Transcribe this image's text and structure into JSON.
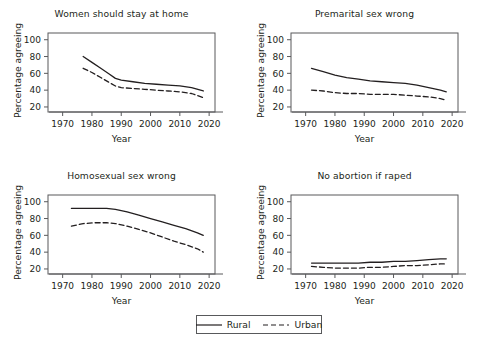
{
  "figure": {
    "background": "#ffffff",
    "line_color": "#231f20",
    "axis_color": "#58595b"
  },
  "legend": {
    "position": "bottom-center",
    "entries": [
      {
        "label": "Rural",
        "style": "solid",
        "icon": "solid-line-swatch"
      },
      {
        "label": "Urban",
        "style": "dashed",
        "icon": "dashed-line-swatch"
      }
    ]
  },
  "chart_data": [
    {
      "type": "line",
      "title": "Women should stay at home",
      "xlabel": "Year",
      "ylabel": "Percentage agreeing",
      "xlim": [
        1965,
        2022
      ],
      "ylim": [
        14,
        108
      ],
      "xticks": [
        1970,
        1980,
        1990,
        2000,
        2010,
        2020
      ],
      "yticks": [
        20,
        40,
        60,
        80,
        100
      ],
      "grid": false,
      "legend": "shared-bottom",
      "series": [
        {
          "name": "Rural",
          "style": "solid",
          "x": [
            1977,
            1980,
            1983,
            1986,
            1988,
            1990,
            1994,
            1998,
            2002,
            2006,
            2010,
            2014,
            2018
          ],
          "values": [
            80,
            73,
            66,
            59,
            54,
            52,
            50,
            48,
            47,
            46,
            45,
            43,
            39
          ]
        },
        {
          "name": "Urban",
          "style": "dashed",
          "x": [
            1977,
            1980,
            1983,
            1986,
            1988,
            1990,
            1994,
            1998,
            2002,
            2006,
            2010,
            2014,
            2018
          ],
          "values": [
            66,
            61,
            55,
            49,
            45,
            43,
            42,
            41,
            40,
            39,
            38,
            36,
            31
          ]
        }
      ]
    },
    {
      "type": "line",
      "title": "Premarital sex wrong",
      "xlabel": "Year",
      "ylabel": "Percentage agreeing",
      "xlim": [
        1965,
        2022
      ],
      "ylim": [
        14,
        108
      ],
      "xticks": [
        1970,
        1980,
        1990,
        2000,
        2010,
        2020
      ],
      "yticks": [
        20,
        40,
        60,
        80,
        100
      ],
      "grid": false,
      "legend": "shared-bottom",
      "series": [
        {
          "name": "Rural",
          "style": "solid",
          "x": [
            1972,
            1976,
            1980,
            1984,
            1988,
            1992,
            1996,
            2000,
            2004,
            2008,
            2012,
            2016,
            2018
          ],
          "values": [
            66,
            62,
            58,
            55,
            53,
            51,
            50,
            49,
            48,
            46,
            43,
            40,
            38
          ]
        },
        {
          "name": "Urban",
          "style": "dashed",
          "x": [
            1972,
            1976,
            1980,
            1984,
            1988,
            1992,
            1996,
            2000,
            2004,
            2008,
            2012,
            2016,
            2018
          ],
          "values": [
            40,
            39,
            37,
            36,
            36,
            35,
            35,
            35,
            34,
            33,
            32,
            30,
            28
          ]
        }
      ]
    },
    {
      "type": "line",
      "title": "Homosexual sex wrong",
      "xlabel": "Year",
      "ylabel": "Percentage agreeing",
      "xlim": [
        1965,
        2022
      ],
      "ylim": [
        14,
        108
      ],
      "xticks": [
        1970,
        1980,
        1990,
        2000,
        2010,
        2020
      ],
      "yticks": [
        20,
        40,
        60,
        80,
        100
      ],
      "grid": false,
      "legend": "shared-bottom",
      "series": [
        {
          "name": "Rural",
          "style": "solid",
          "x": [
            1973,
            1977,
            1981,
            1985,
            1988,
            1992,
            1996,
            2000,
            2004,
            2008,
            2012,
            2016,
            2018
          ],
          "values": [
            92,
            92,
            92,
            92,
            91,
            88,
            84,
            80,
            76,
            72,
            68,
            63,
            60
          ]
        },
        {
          "name": "Urban",
          "style": "dashed",
          "x": [
            1973,
            1977,
            1981,
            1985,
            1988,
            1992,
            1996,
            2000,
            2004,
            2008,
            2012,
            2016,
            2018
          ],
          "values": [
            71,
            74,
            75,
            75,
            74,
            71,
            67,
            63,
            58,
            53,
            49,
            44,
            40
          ]
        }
      ]
    },
    {
      "type": "line",
      "title": "No abortion if raped",
      "xlabel": "Year",
      "ylabel": "Percentage agreeing",
      "xlim": [
        1965,
        2022
      ],
      "ylim": [
        14,
        108
      ],
      "xticks": [
        1970,
        1980,
        1990,
        2000,
        2010,
        2020
      ],
      "yticks": [
        20,
        40,
        60,
        80,
        100
      ],
      "grid": false,
      "legend": "shared-bottom",
      "series": [
        {
          "name": "Rural",
          "style": "solid",
          "x": [
            1972,
            1976,
            1980,
            1984,
            1988,
            1992,
            1996,
            2000,
            2004,
            2008,
            2012,
            2016,
            2018
          ],
          "values": [
            27,
            27,
            27,
            27,
            27,
            28,
            28,
            29,
            29,
            30,
            31,
            32,
            32
          ]
        },
        {
          "name": "Urban",
          "style": "dashed",
          "x": [
            1972,
            1976,
            1980,
            1984,
            1988,
            1992,
            1996,
            2000,
            2004,
            2008,
            2012,
            2016,
            2018
          ],
          "values": [
            23,
            22,
            21,
            21,
            21,
            22,
            22,
            23,
            24,
            24,
            25,
            26,
            26
          ]
        }
      ]
    }
  ]
}
